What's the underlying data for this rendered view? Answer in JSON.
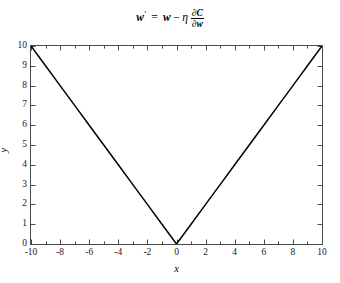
{
  "title": {
    "latex": "w' = w - \\eta \\frac{\\partial C}{\\partial w}",
    "plain": "w' = w - η ∂C/∂w",
    "w_prime": "w",
    "prime": "′",
    "equals": "=",
    "w": "w",
    "minus": "−",
    "eta": "η",
    "numerator_partial": "∂",
    "numerator_var": "C",
    "denominator_partial": "∂",
    "denominator_var": "w"
  },
  "axes": {
    "xlabel": "x",
    "ylabel": "y",
    "xlim": [
      -10,
      10
    ],
    "ylim": [
      0,
      10
    ],
    "xticks": [
      -10,
      -8,
      -6,
      -4,
      -2,
      0,
      2,
      4,
      6,
      8,
      10
    ],
    "xticklabels": [
      "-10",
      "-8",
      "-6",
      "-4",
      "-2",
      "0",
      "2",
      "4",
      "6",
      "8",
      "10"
    ],
    "xminorticks": [
      -9,
      -7,
      -5,
      -3,
      -1,
      1,
      3,
      5,
      7,
      9
    ],
    "yticks": [
      0,
      1,
      2,
      3,
      4,
      5,
      6,
      7,
      8,
      9,
      10
    ],
    "yticklabels": [
      "0",
      "1",
      "2",
      "3",
      "4",
      "5",
      "6",
      "7",
      "8",
      "9",
      "10"
    ],
    "grid": false,
    "box": true,
    "tick_direction": "in",
    "spine_color": "#4a4a4a"
  },
  "chart_data": {
    "type": "line",
    "xlabel": "x",
    "ylabel": "y",
    "xlim": [
      -10,
      10
    ],
    "ylim": [
      0,
      10
    ],
    "grid": false,
    "legend": null,
    "series": [
      {
        "name": "y = |x|",
        "color": "#000000",
        "linewidth": 1.5,
        "x": [
          -10,
          -9,
          -8,
          -7,
          -6,
          -5,
          -4,
          -3,
          -2,
          -1,
          0,
          1,
          2,
          3,
          4,
          5,
          6,
          7,
          8,
          9,
          10
        ],
        "y": [
          10,
          9,
          8,
          7,
          6,
          5,
          4,
          3,
          2,
          1,
          0,
          1,
          2,
          3,
          4,
          5,
          6,
          7,
          8,
          9,
          10
        ]
      }
    ],
    "annotations": [
      {
        "label": "vertex",
        "x": 0,
        "y": 0
      }
    ]
  }
}
